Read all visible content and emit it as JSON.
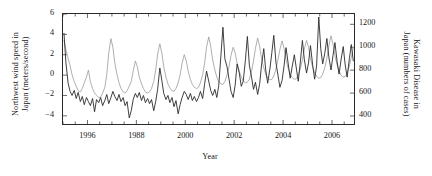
{
  "chart_data": {
    "type": "line",
    "title": "",
    "xlabel": "Year",
    "ylabel_left": "Northwest wind speed in Japan (meters/second)",
    "ylabel_right": "Kawasaki Disease in Japan (numbers of cases)",
    "ylabel_left_line1": "Northwest wind speed in",
    "ylabel_left_line2": "Japan (meters/second)",
    "ylabel_right_line1": "Kawasaki Disease in",
    "ylabel_right_line2": "Japan (numbers of cases)",
    "xlim": [
      1995.0,
      2006.9
    ],
    "ylim_left": [
      -4.8,
      6.0
    ],
    "ylim_right": [
      330,
      1290
    ],
    "grid": false,
    "legend": "none",
    "xticks_major": [
      1996,
      1988,
      2000,
      2002,
      2004,
      2006
    ],
    "xtick_positions": [
      1996,
      1998,
      2000,
      2002,
      2004,
      2006
    ],
    "xticks_minor_step": 0.5,
    "yticks_left": [
      6,
      4,
      2,
      0,
      -2,
      -4
    ],
    "yticks_right": [
      1200,
      1000,
      800,
      600,
      400
    ],
    "series": [
      {
        "name": "Kawasaki Disease in Japan (numbers of cases)",
        "axis": "right",
        "color": "#9a9a9a",
        "x": [
          1995.04,
          1995.12,
          1995.21,
          1995.29,
          1995.37,
          1995.46,
          1995.54,
          1995.62,
          1995.71,
          1995.79,
          1995.87,
          1995.96,
          1996.04,
          1996.12,
          1996.21,
          1996.29,
          1996.37,
          1996.46,
          1996.54,
          1996.62,
          1996.71,
          1996.79,
          1996.87,
          1996.96,
          1997.04,
          1997.12,
          1997.21,
          1997.29,
          1997.37,
          1997.46,
          1997.54,
          1997.62,
          1997.71,
          1997.79,
          1997.87,
          1997.96,
          1998.04,
          1998.12,
          1998.21,
          1998.29,
          1998.37,
          1998.46,
          1998.54,
          1998.62,
          1998.71,
          1998.79,
          1998.87,
          1998.96,
          1999.04,
          1999.12,
          1999.21,
          1999.29,
          1999.37,
          1999.46,
          1999.54,
          1999.62,
          1999.71,
          1999.79,
          1999.87,
          1999.96,
          2000.04,
          2000.12,
          2000.21,
          2000.29,
          2000.37,
          2000.46,
          2000.54,
          2000.62,
          2000.71,
          2000.79,
          2000.87,
          2000.96,
          2001.04,
          2001.12,
          2001.21,
          2001.29,
          2001.37,
          2001.46,
          2001.54,
          2001.62,
          2001.71,
          2001.79,
          2001.87,
          2001.96,
          2002.04,
          2002.12,
          2002.21,
          2002.29,
          2002.37,
          2002.46,
          2002.54,
          2002.62,
          2002.71,
          2002.79,
          2002.87,
          2002.96,
          2003.04,
          2003.12,
          2003.21,
          2003.29,
          2003.37,
          2003.46,
          2003.54,
          2003.62,
          2003.71,
          2003.79,
          2003.87,
          2003.96,
          2004.04,
          2004.12,
          2004.21,
          2004.29,
          2004.37,
          2004.46,
          2004.54,
          2004.62,
          2004.71,
          2004.79,
          2004.87,
          2004.96,
          2005.04,
          2005.12,
          2005.21,
          2005.29,
          2005.37,
          2005.46,
          2005.54,
          2005.62,
          2005.71,
          2005.79,
          2005.87,
          2005.96,
          2006.04,
          2006.12,
          2006.21,
          2006.29,
          2006.37,
          2006.46,
          2006.54,
          2006.62,
          2006.71,
          2006.79,
          2006.87
        ],
        "values": [
          1060,
          980,
          900,
          840,
          760,
          700,
          660,
          620,
          610,
          640,
          690,
          740,
          800,
          700,
          640,
          600,
          580,
          560,
          565,
          600,
          650,
          760,
          950,
          1075,
          1000,
          860,
          760,
          690,
          640,
          610,
          600,
          620,
          660,
          700,
          790,
          880,
          830,
          740,
          680,
          640,
          610,
          600,
          610,
          640,
          700,
          800,
          940,
          1030,
          950,
          830,
          740,
          680,
          645,
          620,
          615,
          640,
          690,
          760,
          860,
          935,
          880,
          790,
          720,
          675,
          650,
          640,
          650,
          690,
          760,
          860,
          1000,
          1090,
          1010,
          890,
          800,
          740,
          700,
          680,
          675,
          700,
          760,
          830,
          930,
          1000,
          950,
          860,
          790,
          740,
          705,
          690,
          695,
          720,
          790,
          880,
          990,
          1080,
          1010,
          900,
          820,
          765,
          730,
          715,
          720,
          750,
          810,
          890,
          980,
          1055,
          990,
          890,
          815,
          765,
          735,
          720,
          725,
          755,
          815,
          890,
          985,
          1060,
          1000,
          900,
          825,
          775,
          745,
          730,
          735,
          765,
          825,
          905,
          1010,
          1100,
          1030,
          925,
          845,
          790,
          755,
          740,
          745,
          775,
          835,
          910,
          995
        ]
      },
      {
        "name": "Northwest wind speed in Japan (meters/second)",
        "axis": "left",
        "color": "#2a2a2a",
        "x": [
          1995.04,
          1995.12,
          1995.21,
          1995.29,
          1995.37,
          1995.46,
          1995.54,
          1995.62,
          1995.71,
          1995.79,
          1995.87,
          1995.96,
          1996.04,
          1996.12,
          1996.21,
          1996.29,
          1996.37,
          1996.46,
          1996.54,
          1996.62,
          1996.71,
          1996.79,
          1996.87,
          1996.96,
          1997.04,
          1997.12,
          1997.21,
          1997.29,
          1997.37,
          1997.46,
          1997.54,
          1997.62,
          1997.71,
          1997.79,
          1997.87,
          1997.96,
          1998.04,
          1998.12,
          1998.21,
          1998.29,
          1998.37,
          1998.46,
          1998.54,
          1998.62,
          1998.71,
          1998.79,
          1998.87,
          1998.96,
          1999.04,
          1999.12,
          1999.21,
          1999.29,
          1999.37,
          1999.46,
          1999.54,
          1999.62,
          1999.71,
          1999.79,
          1999.87,
          1999.96,
          2000.04,
          2000.12,
          2000.21,
          2000.29,
          2000.37,
          2000.46,
          2000.54,
          2000.62,
          2000.71,
          2000.79,
          2000.87,
          2000.96,
          2001.04,
          2001.12,
          2001.21,
          2001.29,
          2001.37,
          2001.46,
          2001.54,
          2001.62,
          2001.71,
          2001.79,
          2001.87,
          2001.96,
          2002.04,
          2002.12,
          2002.21,
          2002.29,
          2002.37,
          2002.46,
          2002.54,
          2002.62,
          2002.71,
          2002.79,
          2002.87,
          2002.96,
          2003.04,
          2003.12,
          2003.21,
          2003.29,
          2003.37,
          2003.46,
          2003.54,
          2003.62,
          2003.71,
          2003.79,
          2003.87,
          2003.96,
          2004.04,
          2004.12,
          2004.21,
          2004.29,
          2004.37,
          2004.46,
          2004.54,
          2004.62,
          2004.71,
          2004.79,
          2004.87,
          2004.96,
          2005.04,
          2005.12,
          2005.21,
          2005.29,
          2005.37,
          2005.46,
          2005.54,
          2005.62,
          2005.71,
          2005.79,
          2005.87,
          2005.96,
          2006.04,
          2006.12,
          2006.21,
          2006.29,
          2006.37,
          2006.46,
          2006.54,
          2006.62,
          2006.71,
          2006.79,
          2006.87
        ],
        "values": [
          4.1,
          1.2,
          -0.8,
          -1.6,
          -2.0,
          -1.5,
          -2.3,
          -1.7,
          -2.6,
          -2.1,
          -2.9,
          -2.2,
          -2.6,
          -3.0,
          -2.3,
          -3.6,
          -2.4,
          -2.7,
          -2.2,
          -3.0,
          -2.5,
          -1.9,
          -2.8,
          -2.2,
          -1.6,
          -2.1,
          -2.5,
          -1.9,
          -2.6,
          -2.2,
          -3.0,
          -2.6,
          -4.2,
          -3.5,
          -2.4,
          -1.8,
          -2.2,
          -1.7,
          -2.5,
          -2.0,
          -2.7,
          -2.3,
          -2.8,
          -2.4,
          -3.5,
          -2.6,
          -1.4,
          0.7,
          -0.5,
          -1.8,
          -2.4,
          -2.0,
          -2.7,
          -2.2,
          -3.1,
          -2.5,
          -3.8,
          -2.9,
          -2.2,
          -1.6,
          -1.9,
          -2.4,
          -1.8,
          -2.5,
          -2.1,
          -2.6,
          -2.2,
          -1.6,
          -2.3,
          -0.9,
          0.4,
          -0.6,
          -1.5,
          -2.0,
          -1.4,
          -2.2,
          -1.0,
          2.0,
          4.7,
          1.6,
          0.8,
          -0.4,
          -1.6,
          -2.2,
          -1.0,
          1.1,
          0.2,
          -1.1,
          -0.6,
          1.5,
          3.8,
          1.0,
          -0.2,
          -1.4,
          -0.7,
          -1.9,
          -0.9,
          1.0,
          2.6,
          0.5,
          -0.8,
          0.6,
          2.2,
          3.9,
          1.2,
          0.0,
          -1.2,
          -0.5,
          0.9,
          2.7,
          1.1,
          -0.3,
          0.8,
          2.0,
          0.7,
          -0.6,
          1.4,
          3.4,
          1.5,
          0.2,
          1.2,
          2.9,
          1.0,
          -0.4,
          0.9,
          5.7,
          2.6,
          1.1,
          2.2,
          3.6,
          1.8,
          0.5,
          1.9,
          3.2,
          1.3,
          0.1,
          1.5,
          2.8,
          1.0,
          -0.2,
          1.6,
          3.0,
          1.4
        ]
      }
    ]
  }
}
